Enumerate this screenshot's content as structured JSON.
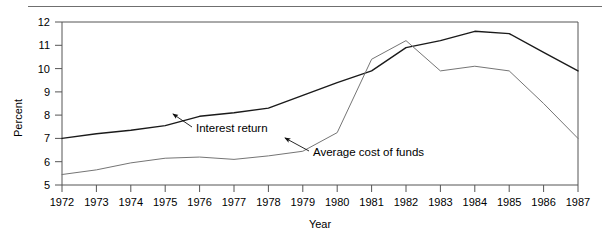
{
  "figure": {
    "name": "interest-return-vs-cost-of-funds-line-chart",
    "top_rule_color": "#6f6f6f",
    "background": "#ffffff"
  },
  "chart_data": {
    "type": "line",
    "title": "",
    "xlabel": "Year",
    "ylabel": "Percent",
    "grid": false,
    "legend_position": "inline-annotations",
    "xlim": [
      1972,
      1987
    ],
    "ylim": [
      5,
      12
    ],
    "ytick_step": 1,
    "x": [
      1972,
      1973,
      1974,
      1975,
      1976,
      1977,
      1978,
      1979,
      1980,
      1981,
      1982,
      1983,
      1984,
      1985,
      1986,
      1987
    ],
    "categories": [
      "1972",
      "1973",
      "1974",
      "1975",
      "1976",
      "1977",
      "1978",
      "1979",
      "1980",
      "1981",
      "1982",
      "1983",
      "1984",
      "1985",
      "1986",
      "1987"
    ],
    "yticks": [
      5,
      6,
      7,
      8,
      9,
      10,
      11,
      12
    ],
    "ytick_labels": [
      "5",
      "6",
      "7",
      "8",
      "9",
      "10",
      "11",
      "12"
    ],
    "series": [
      {
        "name": "Interest return",
        "color": "#1a1a1a",
        "width": 1.4,
        "values": [
          7.0,
          7.2,
          7.35,
          7.55,
          7.95,
          8.1,
          8.3,
          8.85,
          9.4,
          9.9,
          10.9,
          11.2,
          11.6,
          11.5,
          10.7,
          9.9
        ]
      },
      {
        "name": "Average cost of funds",
        "color": "#757575",
        "width": 1.0,
        "values": [
          5.45,
          5.65,
          5.95,
          6.15,
          6.2,
          6.1,
          6.25,
          6.45,
          7.25,
          10.4,
          11.2,
          9.9,
          10.1,
          9.9,
          8.5,
          7.0
        ]
      }
    ],
    "annotations": [
      {
        "label": "Interest return",
        "text_x": 196,
        "text_y": 132,
        "arrow_from_x": 192,
        "arrow_from_y": 127,
        "arrow_to_x": 173,
        "arrow_to_y": 114
      },
      {
        "label": "Average cost of funds",
        "text_x": 313,
        "text_y": 156,
        "arrow_from_x": 309,
        "arrow_from_y": 151,
        "arrow_to_x": 285,
        "arrow_to_y": 138
      }
    ]
  },
  "axes": {
    "x_axis_name": "year-axis",
    "y_axis_name": "percent-axis",
    "plot_left": 62,
    "plot_right": 578,
    "plot_top": 22,
    "plot_bottom": 185,
    "axis_color": "#555555"
  }
}
